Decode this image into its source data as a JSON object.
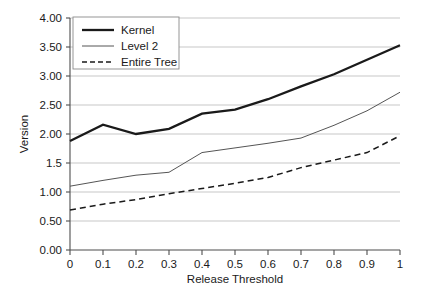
{
  "chart_data": {
    "type": "line",
    "title": "",
    "xlabel": "Release Threshold",
    "ylabel": "Version",
    "xlim": [
      0,
      1
    ],
    "ylim": [
      0,
      4
    ],
    "grid": true,
    "legend_position": "top-left",
    "x": [
      0,
      0.1,
      0.2,
      0.3,
      0.4,
      0.5,
      0.6,
      0.7,
      0.8,
      0.9,
      1
    ],
    "x_ticklabels": [
      "0",
      "0.1",
      "0.2",
      "0.3",
      "0.4",
      "0.5",
      "0.6",
      "0.7",
      "0.8",
      "0.9",
      "1"
    ],
    "y_ticks": [
      0,
      0.5,
      1,
      1.5,
      2,
      2.5,
      3,
      3.5,
      4
    ],
    "y_ticklabels": [
      "0.00",
      "0.50",
      "1.00",
      "1.5",
      "2.00",
      "2.50",
      "3.00",
      "3.50",
      "4.00"
    ],
    "series": [
      {
        "name": "Kernel",
        "style": "solid-thick",
        "color": "#1a1a1a",
        "width": 2.3,
        "values": [
          1.88,
          2.16,
          2.0,
          2.09,
          2.35,
          2.42,
          2.6,
          2.82,
          3.03,
          3.28,
          3.53
        ]
      },
      {
        "name": "Level 2",
        "style": "solid-thin",
        "color": "#555555",
        "width": 1.0,
        "values": [
          1.1,
          1.2,
          1.29,
          1.34,
          1.68,
          1.76,
          1.84,
          1.93,
          2.15,
          2.4,
          2.72
        ]
      },
      {
        "name": "Entire Tree",
        "style": "dashed",
        "color": "#1a1a1a",
        "width": 1.5,
        "values": [
          0.69,
          0.79,
          0.87,
          0.97,
          1.06,
          1.15,
          1.25,
          1.42,
          1.55,
          1.68,
          1.97
        ]
      }
    ]
  },
  "legend": {
    "entries": [
      {
        "label": "Kernel"
      },
      {
        "label": "Level 2"
      },
      {
        "label": "Entire Tree"
      }
    ]
  },
  "axes": {
    "y_title": "Version",
    "x_title": "Release Threshold"
  }
}
